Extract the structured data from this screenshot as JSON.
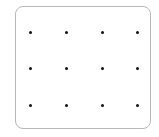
{
  "grid": {
    "rows": 3,
    "cols": 4,
    "dot_color": "#111111",
    "border_color": "#b8b8b8",
    "dots": [
      {
        "x": 30,
        "y": 32
      },
      {
        "x": 66,
        "y": 32
      },
      {
        "x": 102,
        "y": 32
      },
      {
        "x": 137,
        "y": 32
      },
      {
        "x": 30,
        "y": 68
      },
      {
        "x": 66,
        "y": 68
      },
      {
        "x": 102,
        "y": 68
      },
      {
        "x": 137,
        "y": 68
      },
      {
        "x": 30,
        "y": 105
      },
      {
        "x": 66,
        "y": 105
      },
      {
        "x": 102,
        "y": 105
      },
      {
        "x": 137,
        "y": 105
      }
    ]
  }
}
